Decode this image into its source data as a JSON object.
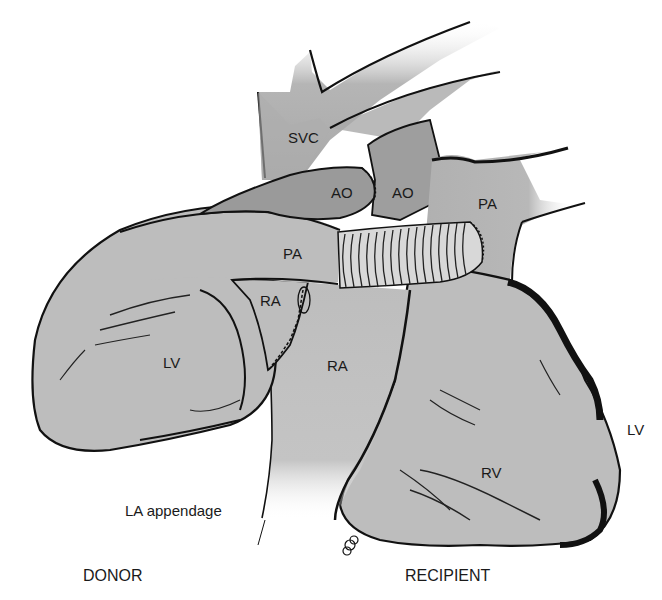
{
  "figure": {
    "colors": {
      "tissue_light": "#bdbdbd",
      "tissue_dark": "#9a9a9a",
      "outline": "#111111",
      "background": "#ffffff",
      "text": "#1a1a1a"
    }
  },
  "labels": {
    "svc": "SVC",
    "ao_donor": "AO",
    "ao_recipient": "AO",
    "pa_donor": "PA",
    "pa_recipient": "PA",
    "ra_donor": "RA",
    "ra_recipient": "RA",
    "lv_donor": "LV",
    "lv_recipient": "LV",
    "rv_recipient": "RV",
    "la_appendage": "LA appendage",
    "donor": "DONOR",
    "recipient": "RECIPIENT"
  }
}
